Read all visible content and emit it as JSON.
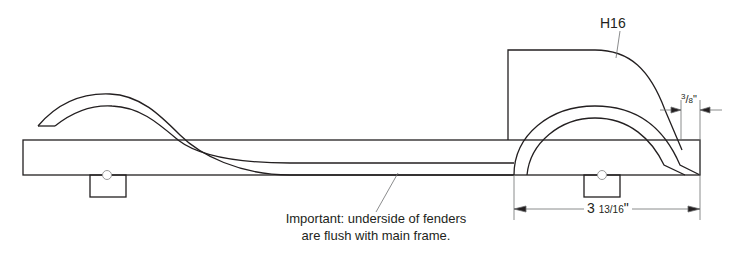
{
  "diagram": {
    "part_label": "H16",
    "dimensions": {
      "fender_offset": {
        "whole": "",
        "numerator": "3",
        "denominator": "8",
        "unit": "\""
      },
      "fender_length": {
        "whole": "3",
        "numerator": "13",
        "denominator": "16",
        "unit": "\""
      }
    },
    "note": {
      "line1": "Important: underside of fenders",
      "line2": "are flush with main frame."
    },
    "colors": {
      "line": "#231f20",
      "leader": "#6d6e70",
      "background": "#ffffff"
    }
  }
}
